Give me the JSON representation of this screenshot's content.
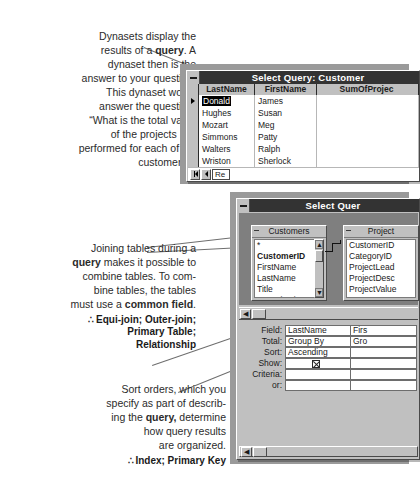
{
  "annotations": {
    "dynaset": {
      "lines": [
        "Dynasets display the",
        "results of a |query|. A",
        "dynaset then is the",
        "answer to your question.",
        "This dynaset would",
        "answer the question,",
        "“What is the total value",
        "of the projects I’ve",
        "performed for each of my",
        "customers?”"
      ],
      "xrefs": []
    },
    "join": {
      "lines": [
        "Joining tables during a",
        "|query| makes it possible to",
        "combine tables. To com-",
        "bine tables, the tables",
        "must use a |common field|."
      ],
      "xref_glyph": "∴",
      "xrefs": [
        "Equi-join; Outer-join;",
        "Primary Table;",
        "Relationship"
      ]
    },
    "sort": {
      "lines": [
        "Sort orders, which you",
        "specify as part of describ-",
        "ing the |query,| determine",
        "how query results",
        "are organized."
      ],
      "xref_glyph": "∴",
      "xrefs": [
        "Index; Primary Key"
      ]
    }
  },
  "datasheet_window": {
    "title": "Select Query: Customer",
    "sysmenu_icon": "minimize-icon",
    "columns": [
      "LastName",
      "FirstName",
      "SumOfProjec"
    ],
    "rows": [
      {
        "last": "Donald",
        "first": "James",
        "sum": "",
        "current": true
      },
      {
        "last": "Hughes",
        "first": "Susan",
        "sum": "",
        "current": false
      },
      {
        "last": "Mozart",
        "first": "Meg",
        "sum": "",
        "current": false
      },
      {
        "last": "Simmons",
        "first": "Patty",
        "sum": "",
        "current": false
      },
      {
        "last": "Walters",
        "first": "Ralph",
        "sum": "",
        "current": false
      },
      {
        "last": "Wriston",
        "first": "Sherlock",
        "sum": "",
        "current": false
      }
    ],
    "nav": {
      "first_icon": "first-record-icon",
      "prev_icon": "previous-record-icon",
      "record_label": "Re"
    }
  },
  "design_window": {
    "title": "Select Quer",
    "sysmenu_icon": "minimize-icon",
    "tables": [
      {
        "name": "Customers",
        "fields": [
          "*",
          "CustomerID",
          "FirstName",
          "LastName",
          "Title",
          "OrganizationNa"
        ],
        "primary_key": "CustomerID",
        "scroll_up_icon": "scroll-up-icon",
        "scroll_down_icon": "scroll-down-icon"
      },
      {
        "name": "Project",
        "fields": [
          "CustomerID",
          "CategoryID",
          "ProjectLead",
          "ProjectDesc",
          "ProjectValue",
          "Note"
        ],
        "primary_key": ""
      }
    ],
    "qbe": {
      "row_labels": [
        "Field:",
        "Total:",
        "Sort:",
        "Show:",
        "Criteria:",
        "or:"
      ],
      "columns": [
        {
          "field": "LastName",
          "total": "Group By",
          "sort": "Ascending",
          "show": true,
          "criteria": "",
          "or": ""
        },
        {
          "field": "Firs",
          "total": "Gro",
          "sort": "",
          "show": false,
          "criteria": "",
          "or": ""
        }
      ]
    },
    "splitter": {
      "left_arrow_icon": "scroll-left-icon"
    },
    "hscroll": {
      "left_arrow_icon": "scroll-left-icon"
    }
  },
  "colors": {
    "window_face": "#c0c0c0",
    "titlebar": "#333333",
    "canvas": "#7f7f7f",
    "text": "#2b2b2b"
  }
}
